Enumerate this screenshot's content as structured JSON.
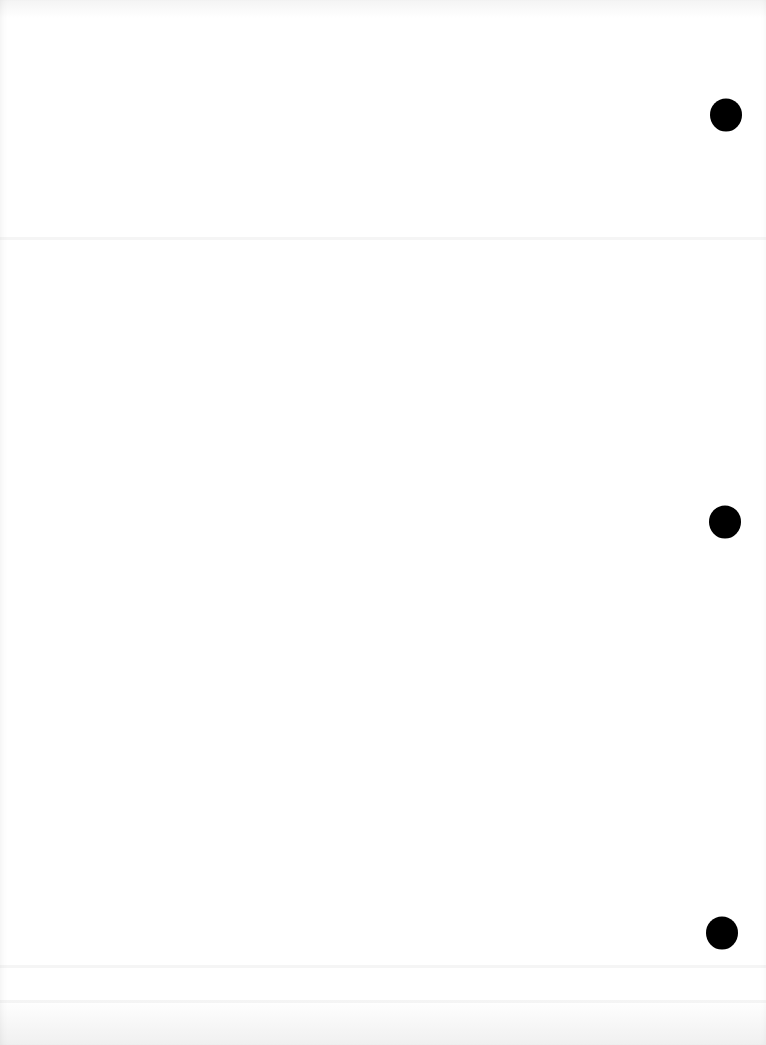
{
  "page": {
    "kind": "blank-scanned-page",
    "background_color": "#ffffff",
    "text_content": ""
  },
  "punch_holes": [
    {
      "x": 726,
      "y": 115,
      "color": "#000000"
    },
    {
      "x": 725,
      "y": 522,
      "color": "#000000"
    },
    {
      "x": 722,
      "y": 933,
      "color": "#000000"
    }
  ]
}
